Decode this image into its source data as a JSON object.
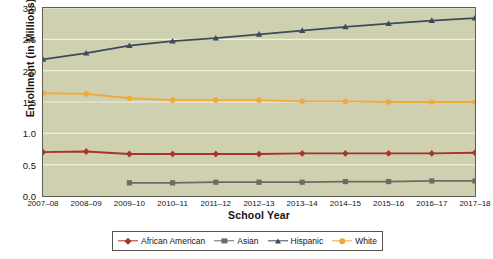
{
  "chart_data": {
    "type": "line",
    "title": "",
    "xlabel": "School Year",
    "ylabel": "Enrollment (in Millions)",
    "ylim": [
      0.0,
      3.0
    ],
    "yticks": [
      "0.0",
      "0.5",
      "1.0",
      "1.5",
      "2.0",
      "2.5",
      "3.0"
    ],
    "grid": true,
    "legend_position": "bottom",
    "categories": [
      "2007–08",
      "2008–09",
      "2009–10",
      "2010–11",
      "2011–12",
      "2012–13",
      "2013–14",
      "2014–15",
      "2015–16",
      "2016–17",
      "2017–18"
    ],
    "series": [
      {
        "name": "African American",
        "color": "#a63429",
        "marker": "diamond",
        "values": [
          0.7,
          0.71,
          0.67,
          0.67,
          0.67,
          0.67,
          0.68,
          0.68,
          0.68,
          0.68,
          0.69
        ]
      },
      {
        "name": "Asian",
        "color": "#6b6b63",
        "marker": "square",
        "values": [
          null,
          null,
          0.21,
          0.21,
          0.22,
          0.22,
          0.22,
          0.23,
          0.23,
          0.24,
          0.24
        ]
      },
      {
        "name": "Hispanic",
        "color": "#3d4a5c",
        "marker": "triangle",
        "values": [
          2.18,
          2.28,
          2.4,
          2.47,
          2.52,
          2.58,
          2.64,
          2.7,
          2.75,
          2.8,
          2.84
        ]
      },
      {
        "name": "White",
        "color": "#f0aa3c",
        "marker": "circle",
        "values": [
          1.64,
          1.63,
          1.56,
          1.53,
          1.53,
          1.53,
          1.51,
          1.51,
          1.5,
          1.5,
          1.5
        ]
      }
    ]
  },
  "colors": {
    "plot_background": "#cfd0b0",
    "gridline": "#eef0e0",
    "axis": "#5d5f57",
    "page_background": "#ffffff"
  }
}
